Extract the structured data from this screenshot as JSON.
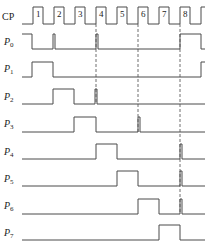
{
  "diagram": {
    "type": "timing-diagram",
    "colors": {
      "line": "#4a4a4a",
      "text": "#222222",
      "background": "#ffffff"
    },
    "clock": {
      "label": "CP",
      "pulse_numbers": [
        "1",
        "2",
        "3",
        "4",
        "5",
        "6",
        "7",
        "8"
      ],
      "baseline_y": 24,
      "high_y": 7,
      "start_x": 22,
      "end_x": 205,
      "rising_edges": [
        33,
        54,
        75,
        96,
        117,
        138,
        159,
        180,
        201
      ],
      "pulse_width": 10
    },
    "signals": [
      {
        "name": "P",
        "sub": "0",
        "low_y": 49,
        "high_y": 34,
        "label_y": 45,
        "segments": [
          [
            22,
            32,
            "high"
          ],
          [
            53,
            55,
            "high"
          ],
          [
            96,
            98,
            "high"
          ],
          [
            180,
            201,
            "high"
          ]
        ]
      },
      {
        "name": "P",
        "sub": "1",
        "low_y": 77,
        "high_y": 62,
        "label_y": 72,
        "segments": [
          [
            32,
            53,
            "high"
          ],
          [
            201,
            205,
            "high"
          ]
        ]
      },
      {
        "name": "P",
        "sub": "2",
        "low_y": 104,
        "high_y": 89,
        "label_y": 100,
        "segments": [
          [
            53,
            74,
            "high"
          ],
          [
            95,
            97,
            "high"
          ]
        ]
      },
      {
        "name": "P",
        "sub": "3",
        "low_y": 132,
        "high_y": 117,
        "label_y": 127,
        "segments": [
          [
            74,
            96,
            "high"
          ],
          [
            138,
            140,
            "high"
          ]
        ]
      },
      {
        "name": "P",
        "sub": "4",
        "low_y": 159,
        "high_y": 144,
        "label_y": 155,
        "segments": [
          [
            96,
            117,
            "high"
          ],
          [
            180,
            182,
            "high"
          ]
        ]
      },
      {
        "name": "P",
        "sub": "5",
        "low_y": 186,
        "high_y": 171,
        "label_y": 182,
        "segments": [
          [
            117,
            138,
            "high"
          ],
          [
            180,
            182,
            "high"
          ]
        ]
      },
      {
        "name": "P",
        "sub": "6",
        "low_y": 214,
        "high_y": 199,
        "label_y": 209,
        "segments": [
          [
            138,
            159,
            "high"
          ],
          [
            180,
            182,
            "high"
          ]
        ]
      },
      {
        "name": "P",
        "sub": "7",
        "low_y": 240,
        "high_y": 225,
        "label_y": 236,
        "segments": [
          [
            159,
            180,
            "high"
          ]
        ]
      }
    ],
    "signal_start_x": 22,
    "signal_end_x": 205,
    "dashed_lines": [
      {
        "x": 96,
        "y1": 24,
        "y2": 104
      },
      {
        "x": 138,
        "y1": 24,
        "y2": 132
      },
      {
        "x": 180,
        "y1": 24,
        "y2": 214
      }
    ]
  }
}
